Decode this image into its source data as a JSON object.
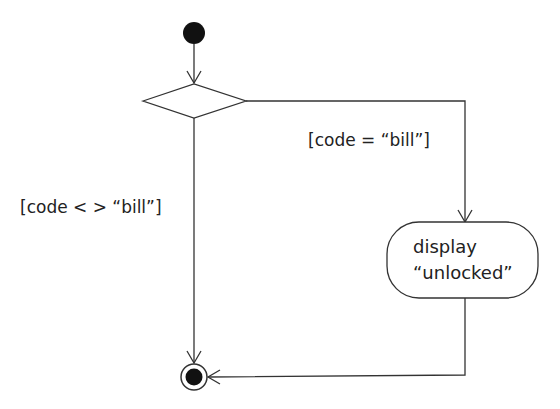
{
  "diagram": {
    "type": "UML activity diagram",
    "nodes": {
      "initial": {
        "kind": "initial-node"
      },
      "decision": {
        "kind": "decision-node"
      },
      "action": {
        "kind": "action",
        "line1": "display",
        "line2": "“unlocked”"
      },
      "final": {
        "kind": "activity-final-node"
      }
    },
    "guards": {
      "equal": "[code = “bill”]",
      "not_equal": "[code < > “bill”]"
    },
    "edges": [
      {
        "from": "initial",
        "to": "decision"
      },
      {
        "from": "decision",
        "to": "action",
        "guard": "[code = “bill”]"
      },
      {
        "from": "decision",
        "to": "final",
        "guard": "[code < > “bill”]"
      },
      {
        "from": "action",
        "to": "final"
      }
    ],
    "colors": {
      "stroke": "#333333",
      "fill": "#111111",
      "background": "#ffffff"
    }
  }
}
